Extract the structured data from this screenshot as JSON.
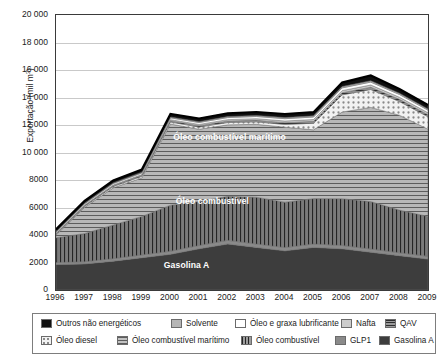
{
  "chart_data": {
    "type": "area",
    "stacked": true,
    "title": "",
    "xlabel": "",
    "ylabel": "Exportação (mil m³)",
    "ylabel_plain": "Exportacao (mil m3)",
    "ylim": [
      0,
      20000
    ],
    "ytick_step": 2000,
    "grid": true,
    "legend_position": "bottom",
    "x": [
      1996,
      1997,
      1998,
      1999,
      2000,
      2001,
      2002,
      2003,
      2004,
      2005,
      2006,
      2007,
      2008,
      2009
    ],
    "xtick_labels": [
      "1996",
      "1997",
      "1998",
      "1999",
      "2000",
      "2001",
      "2002",
      "2003",
      "2004",
      "2005",
      "2006",
      "2007",
      "2008",
      "2009"
    ],
    "ytick_labels": [
      "0",
      "2000",
      "4000",
      "6000",
      "8000",
      "10 000",
      "12 000",
      "14 000",
      "16 000",
      "18 000",
      "20 000"
    ],
    "ytick_values": [
      0,
      2000,
      4000,
      6000,
      8000,
      10000,
      12000,
      14000,
      16000,
      18000,
      20000
    ],
    "series": [
      {
        "name": "Gasolina A",
        "pattern": "solid-dark",
        "color": "#3d3d3d",
        "values": [
          1850,
          1900,
          2100,
          2350,
          2600,
          3000,
          3350,
          3100,
          2850,
          3100,
          3000,
          2750,
          2500,
          2250
        ]
      },
      {
        "name": "GLP1",
        "pattern": "solid-medium",
        "color": "#8a8a8a",
        "values": [
          150,
          160,
          180,
          200,
          220,
          240,
          260,
          250,
          240,
          250,
          240,
          230,
          210,
          200
        ]
      },
      {
        "name": "Óleo combustível",
        "pattern": "vertical-lines",
        "color": "#5e5e5e",
        "values": [
          1800,
          2050,
          2450,
          2800,
          3350,
          3200,
          3200,
          3400,
          3300,
          3300,
          3400,
          3450,
          3100,
          2900
        ]
      },
      {
        "name": "Óleo combustível marítimo",
        "pattern": "horizontal-lines",
        "color": "#9a9a9a",
        "values": [
          200,
          1900,
          2700,
          2800,
          5900,
          5250,
          5200,
          5300,
          5450,
          5000,
          6300,
          6850,
          6900,
          6350
        ]
      },
      {
        "name": "Óleo diesel",
        "pattern": "dotted",
        "color": "#e8e8e8",
        "values": [
          60,
          80,
          100,
          120,
          150,
          160,
          170,
          180,
          200,
          480,
          1250,
          1300,
          1000,
          900
        ]
      },
      {
        "name": "QAV",
        "pattern": "horizontal-lines-dark",
        "color": "#6f6f6f",
        "values": [
          40,
          50,
          60,
          70,
          90,
          100,
          110,
          120,
          130,
          140,
          160,
          170,
          160,
          150
        ]
      },
      {
        "name": "Nafta",
        "pattern": "solid-light",
        "color": "#cccccc",
        "values": [
          30,
          40,
          50,
          60,
          80,
          90,
          100,
          110,
          120,
          130,
          150,
          160,
          150,
          140
        ]
      },
      {
        "name": "Óleo e graxa lubrificante",
        "pattern": "white",
        "color": "#ffffff",
        "values": [
          80,
          90,
          100,
          110,
          130,
          140,
          150,
          160,
          170,
          180,
          200,
          210,
          200,
          190
        ]
      },
      {
        "name": "Solvente",
        "pattern": "solid-lightgray",
        "color": "#b5b5b5",
        "values": [
          40,
          45,
          50,
          55,
          60,
          65,
          70,
          75,
          80,
          85,
          95,
          100,
          95,
          90
        ]
      },
      {
        "name": "Outros não energéticos",
        "pattern": "solid-black",
        "color": "#111111",
        "values": [
          160,
          170,
          180,
          190,
          220,
          230,
          240,
          250,
          260,
          270,
          300,
          380,
          300,
          280
        ]
      }
    ],
    "annotations": [
      {
        "text": "Óleo combustível marítimo",
        "x": 2002.1,
        "y": 11050
      },
      {
        "text": "Óleo combustível",
        "x": 2001.5,
        "y": 6400
      },
      {
        "text": "Gasolina A",
        "x": 2000.6,
        "y": 1750
      }
    ]
  },
  "legend": {
    "row1": [
      {
        "label": "Outros não energéticos",
        "pattern": "solid-black"
      },
      {
        "label": "Solvente",
        "pattern": "solid-lightgray"
      },
      {
        "label": "Óleo e graxa lubrificante",
        "pattern": "white"
      },
      {
        "label": "Nafta",
        "pattern": "solid-light"
      },
      {
        "label": "QAV",
        "pattern": "horizontal-lines-dark"
      }
    ],
    "row2": [
      {
        "label": "Óleo diesel",
        "pattern": "dotted"
      },
      {
        "label": "Óleo combustível marítimo",
        "pattern": "horizontal-lines"
      },
      {
        "label": "Óleo combustível",
        "pattern": "vertical-lines"
      },
      {
        "label": "GLP1",
        "pattern": "solid-medium"
      },
      {
        "label": "Gasolina A",
        "pattern": "solid-dark"
      }
    ]
  }
}
